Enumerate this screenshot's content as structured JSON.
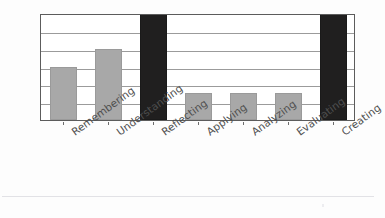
{
  "chart_data": {
    "type": "bar",
    "title": "",
    "subtitle": "",
    "xlabel": "",
    "ylabel": "",
    "categories": [
      "Remembering",
      "Understanding",
      "Reflecting",
      "Applying",
      "Analyzing",
      "Evaluating",
      "Creating"
    ],
    "values": [
      3,
      4,
      6,
      1.5,
      1.5,
      1.5,
      6
    ],
    "ylim": [
      0,
      6
    ],
    "ytick_labels": [],
    "gridlines": 6,
    "grid": true,
    "legend": false,
    "legend_position": "none",
    "bar_colors": [
      "#a8a8a8",
      "#a8a8a8",
      "#201f1f",
      "#a8a8a8",
      "#a8a8a8",
      "#a8a8a8",
      "#201f1f"
    ],
    "series": [
      {
        "name": "",
        "values": [
          3,
          4,
          6,
          1.5,
          1.5,
          1.5,
          6
        ]
      }
    ]
  },
  "style": {
    "frame_color": "#5c5c5c",
    "gridline_color": "#8a8a8a",
    "gray_bar": "#a8a8a8",
    "dark_bar": "#201f1f",
    "background": "#ffffff",
    "label_color": "#4f4f4f"
  }
}
